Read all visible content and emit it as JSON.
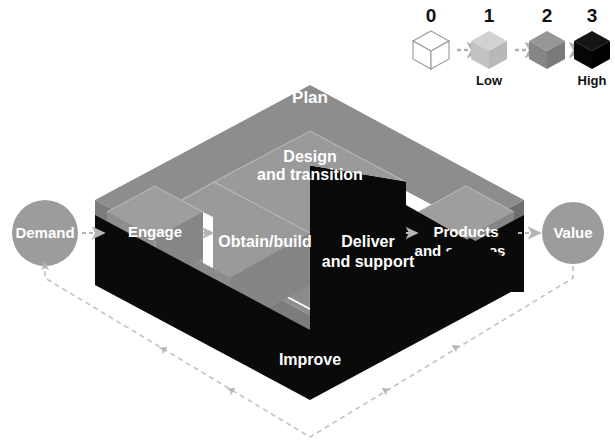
{
  "diagram": {
    "type": "isometric-block-diagram",
    "background_color": "#ffffff"
  },
  "legend": {
    "name": "maturity-scale",
    "caption_low": "Low",
    "caption_high": "High",
    "items": [
      {
        "level": "0",
        "color": "#ffffff",
        "outline": "#9a9a9a",
        "label": ""
      },
      {
        "level": "1",
        "color": "#c9c9c9",
        "outline": "#b4b4b4",
        "label": "Low"
      },
      {
        "level": "2",
        "color": "#8d8d8d",
        "outline": "#7a7a7a",
        "label": ""
      },
      {
        "level": "3",
        "color": "#0b0b0b",
        "outline": "#000000",
        "label": "High"
      }
    ],
    "arrow_color": "#b0b0b0"
  },
  "endpoints": {
    "demand": {
      "label": "Demand",
      "color": "#9c9c9c",
      "text_color": "#ffffff"
    },
    "value": {
      "label": "Value",
      "color": "#9c9c9c",
      "text_color": "#ffffff"
    }
  },
  "activities": {
    "plan": {
      "label": "Plan",
      "level": 1,
      "color": "#8d8d8d"
    },
    "design_and_transition": {
      "label_line1": "Design",
      "label_line2": "and transition",
      "level": 2,
      "color": "#8d8d8d"
    },
    "obtain_build": {
      "label": "Obtain/build",
      "level": 2,
      "color": "#8d8d8d"
    },
    "deliver_and_support": {
      "label_line1": "Deliver",
      "label_line2": "and support",
      "level": 3,
      "color": "#090909"
    },
    "engage": {
      "label": "Engage",
      "level": 1,
      "color": "#8d8d8d"
    },
    "products_and_services": {
      "label_line1": "Products",
      "label_line2": "and services",
      "level": 1,
      "color": "#8d8d8d"
    },
    "improve": {
      "label": "Improve",
      "level": 3,
      "color": "#090909"
    }
  },
  "colors": {
    "base_top": "#8d8d8d",
    "base_side_left": "#7f7f7f",
    "base_side_right": "#6f6f6f",
    "base_dark": "#0a0a0a",
    "cube_face_top": "#9b9b9b",
    "cube_face_left": "#8a8a8a",
    "cube_face_right": "#7c7c7c",
    "white_gap": "#ffffff",
    "dashed_arrow": "#b5b5b5",
    "feedback_loop": "#bdbdbd"
  },
  "feedback_loop": {
    "name": "value-to-demand-feedback",
    "style": "dashed",
    "direction": "value-to-demand",
    "arrow_count": 5
  },
  "connectors": [
    {
      "from": "demand",
      "to": "engage"
    },
    {
      "from": "engage",
      "to": "obtain_build"
    },
    {
      "from": "deliver_and_support",
      "to": "products_and_services"
    },
    {
      "from": "products_and_services",
      "to": "value"
    }
  ]
}
